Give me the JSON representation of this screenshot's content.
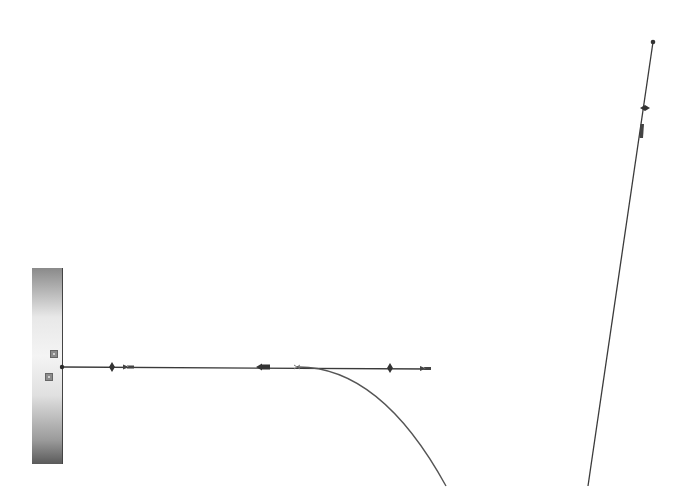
{
  "diagram": {
    "type": "cantilever-beam-deflection-sketch",
    "colors": {
      "line": "#3a3a3a",
      "curve": "#5a5a5a",
      "wall_dark": "#5a5a5a",
      "wall_light": "#f4f4f4",
      "background": "#ffffff"
    },
    "wall": {
      "x": 32,
      "y": 268,
      "width": 30,
      "height": 196
    },
    "wall_markers": [
      {
        "name": "wall-marker-upper",
        "x": 50,
        "y": 350
      },
      {
        "name": "wall-marker-lower",
        "x": 45,
        "y": 373
      }
    ],
    "beam_axis": {
      "start": [
        62,
        367
      ],
      "end": [
        430,
        369
      ],
      "markers": [
        {
          "type": "diamond",
          "x": 112
        },
        {
          "type": "arrow-head",
          "x": 128
        },
        {
          "type": "arrow-left",
          "x": 265
        },
        {
          "type": "small-cross",
          "x": 297
        },
        {
          "type": "diamond",
          "x": 390
        },
        {
          "type": "arrow-head",
          "x": 426
        }
      ]
    },
    "deflection_curve": {
      "start": [
        297,
        367
      ],
      "control": [
        390,
        370
      ],
      "end": [
        446,
        486
      ]
    },
    "inclined_line": {
      "start": [
        653,
        42
      ],
      "end": [
        588,
        486
      ],
      "markers": [
        {
          "type": "end-dot",
          "at": [
            653,
            42
          ]
        },
        {
          "type": "diamond",
          "at": [
            645,
            108
          ]
        },
        {
          "type": "arrow-head",
          "at": [
            642,
            130
          ]
        }
      ]
    }
  }
}
